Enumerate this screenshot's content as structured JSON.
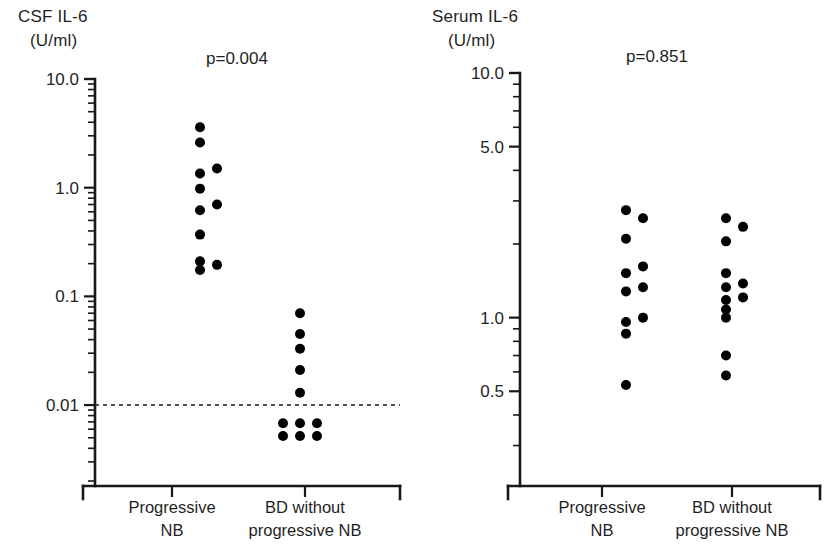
{
  "figure": {
    "type": "dot-plot-pair",
    "background": "#ffffff",
    "dot_color": "#000000",
    "axis_color": "#181818"
  },
  "panels": [
    {
      "id": "csf",
      "axis_title_line1": "CSF IL-6",
      "axis_title_line2": "(U/ml)",
      "pvalue": "p=0.004",
      "y_scale": "log",
      "y_ticks": [
        "10.0",
        "1.0",
        "0.1",
        "0.01"
      ],
      "y_tick_values": [
        10.0,
        1.0,
        0.1,
        0.01
      ],
      "ylim": [
        0.0018,
        10.0
      ],
      "reference_line": {
        "value": 0.01,
        "style": "dashed"
      },
      "groups": [
        {
          "label_line1": "Progressive",
          "label_line2": "NB"
        },
        {
          "label_line1": "BD without",
          "label_line2": "progressive NB"
        }
      ]
    },
    {
      "id": "serum",
      "axis_title_line1": "Serum IL-6",
      "axis_title_line2": "(U/ml)",
      "pvalue": "p=0.851",
      "y_scale": "log",
      "y_ticks": [
        "10.0",
        "5.0",
        "1.0",
        "0.5"
      ],
      "y_tick_values": [
        10.0,
        5.0,
        1.0,
        0.5
      ],
      "ylim": [
        0.2,
        10.0
      ],
      "reference_line": null,
      "groups": [
        {
          "label_line1": "Progressive",
          "label_line2": "NB"
        },
        {
          "label_line1": "BD without",
          "label_line2": "progressive NB"
        }
      ]
    }
  ],
  "chart_data": [
    {
      "type": "scatter",
      "title": "CSF IL-6 (U/ml)",
      "xlabel": "",
      "ylabel": "CSF IL-6 (U/ml)",
      "yscale": "log",
      "ylim": [
        0.0018,
        10.0
      ],
      "ytick_labels": [
        "10.0",
        "1.0",
        "0.1",
        "0.01"
      ],
      "ytick_values": [
        10.0,
        1.0,
        0.1,
        0.01
      ],
      "grid": false,
      "legend": "none",
      "annotations": [
        "p=0.004"
      ],
      "reference_line_y": 0.01,
      "categories": [
        "Progressive NB",
        "BD without progressive NB"
      ],
      "series": [
        {
          "name": "Progressive NB",
          "n": 9,
          "values": [
            3.6,
            2.6,
            1.35,
            1.5,
            0.98,
            0.62,
            0.7,
            0.37,
            0.2,
            0.18
          ],
          "points": [
            {
              "value": 3.6,
              "jitter": 0
            },
            {
              "value": 2.6,
              "jitter": 0
            },
            {
              "value": 1.35,
              "jitter": 0
            },
            {
              "value": 1.5,
              "jitter": 1
            },
            {
              "value": 0.98,
              "jitter": 0
            },
            {
              "value": 0.62,
              "jitter": 0
            },
            {
              "value": 0.7,
              "jitter": 1
            },
            {
              "value": 0.37,
              "jitter": 0
            },
            {
              "value": 0.21,
              "jitter": 0
            },
            {
              "value": 0.175,
              "jitter": 0
            },
            {
              "value": 0.195,
              "jitter": 1
            }
          ]
        },
        {
          "name": "BD without progressive NB",
          "n": 11,
          "values": [
            0.07,
            0.045,
            0.033,
            0.021,
            0.013,
            0.0068,
            0.0068,
            0.0068,
            0.0052,
            0.0052,
            0.0052
          ],
          "points": [
            {
              "value": 0.07,
              "jitter": 0
            },
            {
              "value": 0.045,
              "jitter": 0
            },
            {
              "value": 0.033,
              "jitter": 0
            },
            {
              "value": 0.021,
              "jitter": 0
            },
            {
              "value": 0.013,
              "jitter": 0
            },
            {
              "value": 0.0068,
              "jitter": -1
            },
            {
              "value": 0.0068,
              "jitter": 0
            },
            {
              "value": 0.0068,
              "jitter": 1
            },
            {
              "value": 0.0052,
              "jitter": -1
            },
            {
              "value": 0.0052,
              "jitter": 0
            },
            {
              "value": 0.0052,
              "jitter": 1
            }
          ]
        }
      ]
    },
    {
      "type": "scatter",
      "title": "Serum IL-6 (U/ml)",
      "xlabel": "",
      "ylabel": "Serum IL-6 (U/ml)",
      "yscale": "log",
      "ylim": [
        0.2,
        10.0
      ],
      "ytick_labels": [
        "10.0",
        "5.0",
        "1.0",
        "0.5"
      ],
      "ytick_values": [
        10.0,
        5.0,
        1.0,
        0.5
      ],
      "grid": false,
      "legend": "none",
      "annotations": [
        "p=0.851"
      ],
      "reference_line_y": null,
      "categories": [
        "Progressive NB",
        "BD without progressive NB"
      ],
      "series": [
        {
          "name": "Progressive NB",
          "n": 11,
          "values": [
            2.7,
            2.6,
            2.1,
            1.55,
            1.6,
            1.3,
            1.35,
            0.95,
            1.0,
            0.85,
            0.53
          ],
          "points": [
            {
              "value": 2.75,
              "jitter": 0
            },
            {
              "value": 2.55,
              "jitter": 1
            },
            {
              "value": 2.1,
              "jitter": 0
            },
            {
              "value": 1.52,
              "jitter": 0
            },
            {
              "value": 1.62,
              "jitter": 1
            },
            {
              "value": 1.28,
              "jitter": 0
            },
            {
              "value": 1.33,
              "jitter": 1
            },
            {
              "value": 0.96,
              "jitter": 0
            },
            {
              "value": 1.0,
              "jitter": 1
            },
            {
              "value": 0.86,
              "jitter": 0
            },
            {
              "value": 0.53,
              "jitter": 0
            }
          ]
        },
        {
          "name": "BD without progressive NB",
          "n": 11,
          "values": [
            2.55,
            2.35,
            2.05,
            1.55,
            1.35,
            1.4,
            1.2,
            1.25,
            1.1,
            1.0,
            0.7,
            0.58
          ],
          "points": [
            {
              "value": 2.55,
              "jitter": 0
            },
            {
              "value": 2.35,
              "jitter": 1
            },
            {
              "value": 2.05,
              "jitter": 0
            },
            {
              "value": 1.52,
              "jitter": 0
            },
            {
              "value": 1.33,
              "jitter": 0
            },
            {
              "value": 1.38,
              "jitter": 1
            },
            {
              "value": 1.18,
              "jitter": 0
            },
            {
              "value": 1.21,
              "jitter": 1
            },
            {
              "value": 1.08,
              "jitter": 0
            },
            {
              "value": 1.0,
              "jitter": 0
            },
            {
              "value": 0.7,
              "jitter": 0
            },
            {
              "value": 0.58,
              "jitter": 0
            }
          ]
        }
      ]
    }
  ]
}
